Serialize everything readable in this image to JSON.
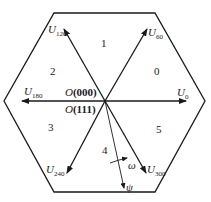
{
  "diagram": {
    "type": "space-vector-hexagon",
    "vectors": [
      {
        "id": "U0",
        "symbol": "U",
        "sub": "0"
      },
      {
        "id": "U60",
        "symbol": "U",
        "sub": "60"
      },
      {
        "id": "U120",
        "symbol": "U",
        "sub": "120"
      },
      {
        "id": "U180",
        "symbol": "U",
        "sub": "180"
      },
      {
        "id": "U240",
        "symbol": "U",
        "sub": "240"
      },
      {
        "id": "U300",
        "symbol": "U",
        "sub": "300"
      }
    ],
    "sectors": [
      "0",
      "1",
      "2",
      "3",
      "4",
      "5"
    ],
    "origin_labels": {
      "top": {
        "symbol": "O",
        "state": "(000)"
      },
      "bottom": {
        "symbol": "O",
        "state": "(111)"
      }
    },
    "flux_label": "ψ",
    "rotation_label": "ω",
    "line_color": "#1a1a1a"
  }
}
